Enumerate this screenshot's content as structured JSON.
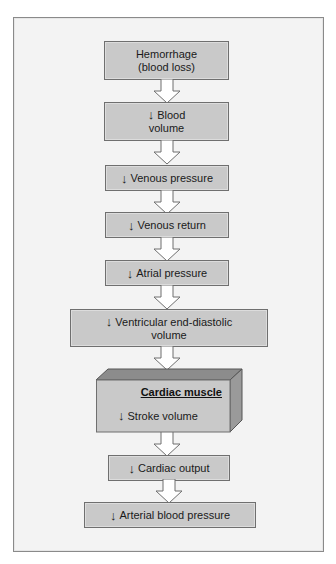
{
  "diagram": {
    "type": "flowchart",
    "direction": "top-to-bottom",
    "colors": {
      "panel_bg": "#f3f3f3",
      "box_fill": "#c9c9c9",
      "box_border": "#6f6f6f",
      "arrow_fill": "#ffffff",
      "cube_top": "#8c8c8c",
      "cube_side": "#9a9a9a"
    },
    "decrease_symbol": "↓",
    "nodes": [
      {
        "id": "hemorrhage",
        "line1": "Hemorrhage",
        "line2": "(blood loss)",
        "decrease": false
      },
      {
        "id": "blood-volume",
        "line1": "Blood",
        "line2": "volume",
        "decrease": true
      },
      {
        "id": "venous-pressure",
        "label": "Venous pressure",
        "decrease": true
      },
      {
        "id": "venous-return",
        "label": "Venous return",
        "decrease": true
      },
      {
        "id": "atrial-pressure",
        "label": "Atrial pressure",
        "decrease": true
      },
      {
        "id": "ventricular-edv",
        "line1": "Ventricular end-diastolic",
        "line2": "volume",
        "decrease": true
      },
      {
        "id": "stroke-volume",
        "container_title": "Cardiac muscle",
        "label": "Stroke volume",
        "decrease": true,
        "shape": "3d-box"
      },
      {
        "id": "cardiac-output",
        "label": "Cardiac output",
        "decrease": true
      },
      {
        "id": "arterial-bp",
        "label": "Arterial blood pressure",
        "decrease": true
      }
    ],
    "edges": [
      [
        "hemorrhage",
        "blood-volume"
      ],
      [
        "blood-volume",
        "venous-pressure"
      ],
      [
        "venous-pressure",
        "venous-return"
      ],
      [
        "venous-return",
        "atrial-pressure"
      ],
      [
        "atrial-pressure",
        "ventricular-edv"
      ],
      [
        "ventricular-edv",
        "stroke-volume"
      ],
      [
        "stroke-volume",
        "cardiac-output"
      ],
      [
        "cardiac-output",
        "arterial-bp"
      ]
    ]
  }
}
